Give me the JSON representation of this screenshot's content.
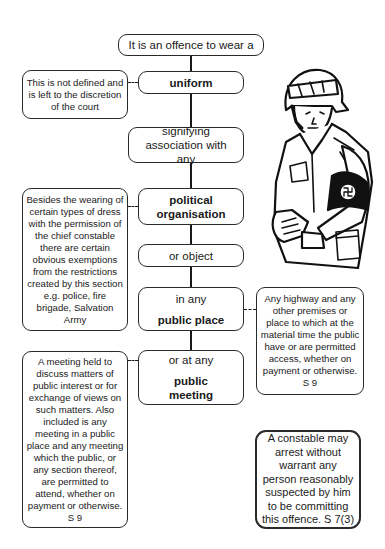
{
  "flow": {
    "start": "It is an offence to wear a",
    "uniform": "uniform",
    "signifying": "signifying association with any",
    "political": "political organisation",
    "object": "or object",
    "public_place_prefix": "in any",
    "public_place": "public place",
    "public_meeting_prefix": "or at any",
    "public_meeting": "public meeting"
  },
  "notes": {
    "uniform_note": "This is not defined and is left to the discretion of the court",
    "political_note": "Besides the wearing of certain types of dress with the permission of the chief constable there are certain obvious exemptions from the restrictions created by this section e.g. police, fire brigade, Salvation Army",
    "public_place_note": "Any highway and any other premises or place to which at the material time the public have or are permitted access, whether on payment or otherwise. S 9",
    "public_meeting_note": "A meeting held to discuss matters of public interest or for exchange of views on such matters. Also included is any meeting in a public place and any meeting which the public, or any section thereof, are permitted to attend, whether on payment or otherwise. S 9",
    "arrest_note": "A constable may arrest without warrant any person reasonably suspected by him to be committing this offence. S 7(3)"
  },
  "illustration": {
    "subject": "soldier-with-armband"
  }
}
